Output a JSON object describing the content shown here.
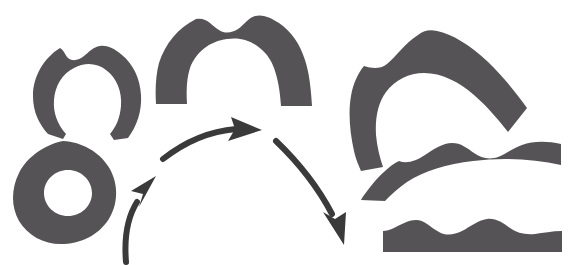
{
  "figure": {
    "canvas": {
      "width": 577,
      "height": 265
    },
    "background_color": "#FFFFFF",
    "shape_fill_color": "#555355",
    "arrow_color": "#3A3A3A",
    "hole_color": "#FFFFFF",
    "shape_count": 6,
    "arrow_count": 3
  },
  "shapes": [
    {
      "id": "shape-1",
      "name": "upper-left-horseshoe",
      "label": "Open horseshoe / omega loop",
      "topology": "open band, downward opening",
      "bbox": [
        32,
        38,
        140,
        140
      ]
    },
    {
      "id": "shape-2",
      "name": "lower-left-ring",
      "label": "Closed ring with central hole",
      "topology": "annulus, genus 1",
      "bbox": [
        12,
        140,
        116,
        245
      ],
      "hole": {
        "cx": 68,
        "cy": 193,
        "rx": 24,
        "ry": 23
      }
    },
    {
      "id": "shape-3",
      "name": "center-arch",
      "label": "Thick inverted-U arch",
      "topology": "open band, downward opening",
      "bbox": [
        155,
        12,
        320,
        108
      ]
    },
    {
      "id": "shape-4",
      "name": "right-top-curved-band",
      "label": "Hook-shaped curved band",
      "topology": "open band, leftward opening",
      "bbox": [
        350,
        30,
        528,
        172
      ]
    },
    {
      "id": "shape-5",
      "name": "right-middle-wavy-band",
      "label": "Wavy band, gently arched",
      "topology": "open band, nearly flat",
      "bbox": [
        360,
        144,
        562,
        202
      ]
    },
    {
      "id": "shape-6",
      "name": "right-bottom-flat-band",
      "label": "Flat band with two bumps",
      "topology": "open band, flat",
      "bbox": [
        383,
        211,
        562,
        253
      ]
    }
  ],
  "arrows": [
    {
      "id": "arrow-1",
      "name": "arrow-ring-to-arch",
      "direction": "up-right",
      "from": [
        126,
        262
      ],
      "to": [
        156,
        176
      ]
    },
    {
      "id": "arrow-2",
      "name": "arrow-arch-ascending",
      "direction": "right",
      "from": [
        163,
        159
      ],
      "to": [
        259,
        128
      ]
    },
    {
      "id": "arrow-3",
      "name": "arrow-arch-descending",
      "direction": "down-right",
      "from": [
        276,
        141
      ],
      "to": [
        344,
        243
      ]
    }
  ]
}
